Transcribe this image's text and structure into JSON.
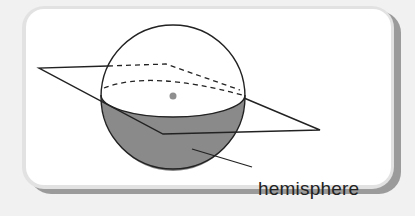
{
  "figure": {
    "label": "hemisphere",
    "colors": {
      "background": "#f1f1f1",
      "panel": "#ffffff",
      "frame_shadow": "#8c8c8c",
      "hemisphere_fill": "#8a8a8a",
      "stroke": "#222222",
      "center_dot": "#8f8f8f"
    },
    "elements": [
      "sphere",
      "intersecting plane",
      "great circle (dashed back half)",
      "center point",
      "shaded lower hemisphere",
      "label leader line"
    ]
  }
}
